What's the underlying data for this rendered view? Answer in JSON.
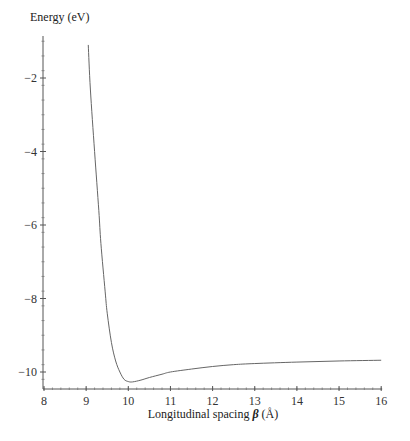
{
  "chart_data": {
    "type": "line",
    "title": "",
    "xlabel": "Longitudinal spacing β (Å)",
    "xlabel_parts": {
      "prefix": "Longitudinal spacing ",
      "symbol": "β",
      "suffix": " (Å)"
    },
    "ylabel": "Energy (eV)",
    "xlim": [
      8,
      16
    ],
    "ylim": [
      -10.46,
      -0.9
    ],
    "x_ticks": [
      8,
      9,
      10,
      11,
      12,
      13,
      14,
      15,
      16
    ],
    "x_tick_labels": [
      "8",
      "9",
      "10",
      "11",
      "12",
      "13",
      "14",
      "15",
      "16"
    ],
    "y_ticks": [
      -2,
      -4,
      -6,
      -8,
      -10
    ],
    "y_tick_labels": [
      "−2",
      "−4",
      "−6",
      "−8",
      "−10"
    ],
    "minor_ticks": true,
    "grid": false,
    "legend": null,
    "series": [
      {
        "name": "Energy",
        "color": "#666666",
        "x": [
          9.05,
          9.1,
          9.2,
          9.3,
          9.35,
          9.45,
          9.5,
          9.6,
          9.7,
          9.8,
          9.9,
          10.0,
          10.1,
          10.3,
          10.5,
          10.8,
          11.0,
          11.5,
          12.0,
          12.5,
          13.0,
          14.0,
          15.0,
          16.0
        ],
        "y": [
          -1.1,
          -2.3,
          -4.0,
          -5.6,
          -6.5,
          -7.8,
          -8.4,
          -9.2,
          -9.7,
          -10.0,
          -10.2,
          -10.26,
          -10.27,
          -10.22,
          -10.15,
          -10.06,
          -10.0,
          -9.92,
          -9.85,
          -9.8,
          -9.77,
          -9.73,
          -9.7,
          -9.68
        ]
      }
    ]
  },
  "layout": {
    "plot_left_px": 44,
    "plot_right_px": 381,
    "plot_bottom_px": 389,
    "x_px_per_unit": 42.15,
    "y_zero_ref_value": -2,
    "y_zero_ref_px": 78,
    "y_px_per_unit": 36.75
  }
}
